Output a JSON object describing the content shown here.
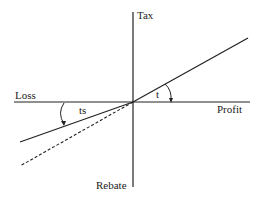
{
  "diagram": {
    "type": "tax-schedule",
    "axes": {
      "y_top_label": "Tax",
      "y_bottom_label": "Rebate",
      "x_left_label": "Loss",
      "x_right_label": "Profit"
    },
    "angle_labels": {
      "profit_side": "t",
      "loss_side": "ts"
    },
    "lines": [
      {
        "name": "tax-line-profit",
        "style": "solid",
        "description": "Tax at rate t on profit"
      },
      {
        "name": "rebate-line-loss",
        "style": "solid",
        "description": "Rebate at rate ts on loss"
      },
      {
        "name": "full-rebate-line",
        "style": "dashed",
        "description": "Extension of rate t into loss region"
      }
    ],
    "colors": {
      "line": "#222222",
      "background": "#ffffff"
    }
  }
}
